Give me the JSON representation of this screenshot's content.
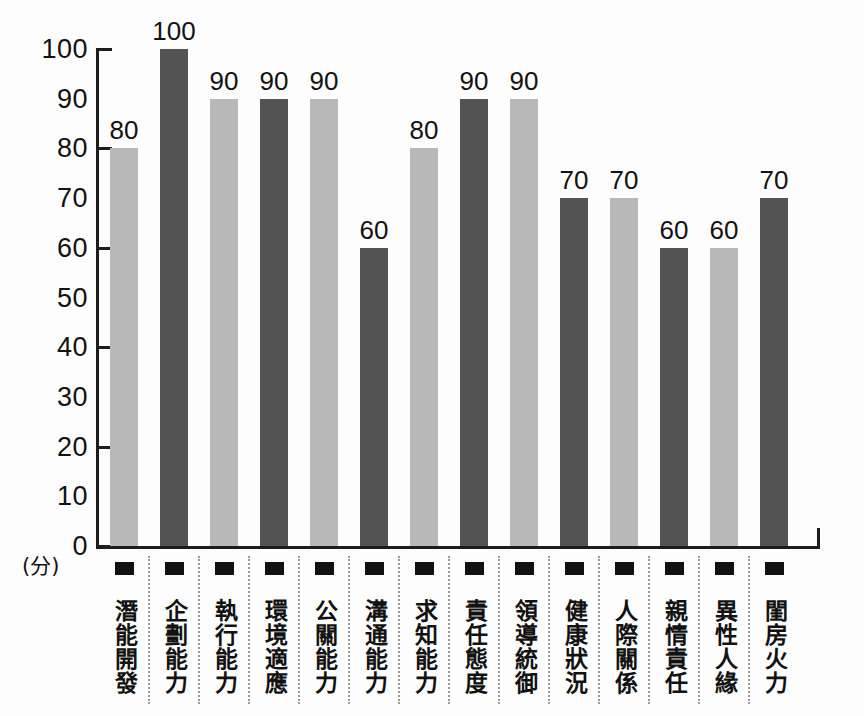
{
  "chart_data": {
    "type": "bar",
    "title": "",
    "xlabel": "",
    "ylabel": "(分)",
    "ylim": [
      0,
      100
    ],
    "ytick_labels": [
      "100",
      "90",
      "80",
      "70",
      "60",
      "50",
      "40",
      "30",
      "20",
      "10",
      "0"
    ],
    "ytick_values": [
      100,
      90,
      80,
      70,
      60,
      50,
      40,
      30,
      20,
      10,
      0
    ],
    "major_ticks": [
      100,
      80,
      60,
      40,
      20,
      0
    ],
    "grid": false,
    "legend": "none",
    "categories": [
      "潛能開發",
      "企劃能力",
      "執行能力",
      "環境適應",
      "公關能力",
      "溝通能力",
      "求知能力",
      "責任態度",
      "領導統御",
      "健康狀況",
      "人際關係",
      "親情責任",
      "異性人緣",
      "閨房火力"
    ],
    "values": [
      80,
      100,
      90,
      90,
      90,
      60,
      80,
      90,
      90,
      70,
      70,
      60,
      60,
      70
    ],
    "bar_colors": [
      "#b8b8b8",
      "#535353",
      "#b8b8b8",
      "#535353",
      "#b8b8b8",
      "#535353",
      "#b8b8b8",
      "#535353",
      "#b8b8b8",
      "#535353",
      "#b8b8b8",
      "#535353",
      "#b8b8b8",
      "#535353"
    ],
    "data_labels": [
      "80",
      "100",
      "90",
      "90",
      "90",
      "60",
      "80",
      "90",
      "90",
      "70",
      "70",
      "60",
      "60",
      "70"
    ],
    "marker_color": "#111111",
    "axis_color": "#1d1d1d",
    "text_color": "#121212",
    "separator_color": "#9a9a9a",
    "background": "#fdfdfd"
  }
}
